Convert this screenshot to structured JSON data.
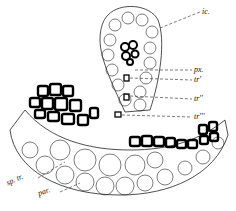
{
  "figure": {
    "labels": {
      "ic": "ic.",
      "px": "px.",
      "tr1": "tr'",
      "tr2": "tr''",
      "tr3": "tr'''",
      "sp_tr": "sp. tr.",
      "par": "par."
    },
    "colors": {
      "ink": "#111111",
      "background": "#ffffff"
    }
  }
}
